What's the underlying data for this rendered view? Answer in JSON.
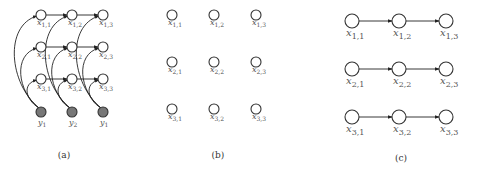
{
  "panels": [
    {
      "id": "a",
      "caption": "(a)",
      "caption_pos": [
        64,
        158
      ],
      "description": "Grid of latent nodes x_{i,j} with horizontal chains and observed nodes y connected to all nodes in column",
      "nodes": [
        {
          "id": "x11",
          "var": "x",
          "sub": "1,1",
          "cx": 41,
          "cy": 15,
          "r": 5
        },
        {
          "id": "x12",
          "var": "x",
          "sub": "1,2",
          "cx": 72,
          "cy": 15,
          "r": 5
        },
        {
          "id": "x13",
          "var": "x",
          "sub": "1,3",
          "cx": 103,
          "cy": 15,
          "r": 5
        },
        {
          "id": "x21",
          "var": "x",
          "sub": "2,1",
          "cx": 41,
          "cy": 47,
          "r": 5
        },
        {
          "id": "x22",
          "var": "x",
          "sub": "2,2",
          "cx": 72,
          "cy": 47,
          "r": 5
        },
        {
          "id": "x23",
          "var": "x",
          "sub": "2,3",
          "cx": 103,
          "cy": 47,
          "r": 5
        },
        {
          "id": "x31",
          "var": "x",
          "sub": "3,1",
          "cx": 41,
          "cy": 79,
          "r": 5
        },
        {
          "id": "x32",
          "var": "x",
          "sub": "3,2",
          "cx": 72,
          "cy": 79,
          "r": 5
        },
        {
          "id": "x33",
          "var": "x",
          "sub": "3,3",
          "cx": 103,
          "cy": 79,
          "r": 5
        }
      ],
      "observed": [
        {
          "id": "y1",
          "var": "y",
          "sub": "1",
          "cx": 41,
          "cy": 112,
          "r": 5
        },
        {
          "id": "y2",
          "var": "y",
          "sub": "2",
          "cx": 72,
          "cy": 112,
          "r": 5
        },
        {
          "id": "y3",
          "var": "y",
          "sub": "1",
          "cx": 103,
          "cy": 112,
          "r": 5
        }
      ],
      "arrows": [
        [
          "x11",
          "x12"
        ],
        [
          "x12",
          "x13"
        ],
        [
          "x21",
          "x22"
        ],
        [
          "x22",
          "x23"
        ],
        [
          "x31",
          "x32"
        ],
        [
          "x32",
          "x33"
        ]
      ],
      "column_links": [
        [
          "y1",
          "x11"
        ],
        [
          "y1",
          "x21"
        ],
        [
          "y1",
          "x31"
        ],
        [
          "y2",
          "x12"
        ],
        [
          "y2",
          "x22"
        ],
        [
          "y2",
          "x32"
        ],
        [
          "y3",
          "x13"
        ],
        [
          "y3",
          "x23"
        ],
        [
          "y3",
          "x33"
        ]
      ]
    },
    {
      "id": "b",
      "caption": "(b)",
      "caption_pos": [
        218,
        158
      ],
      "description": "Independent latent nodes, no edges",
      "nodes": [
        {
          "id": "x11",
          "var": "x",
          "sub": "1,1",
          "cx": 172,
          "cy": 15,
          "r": 5
        },
        {
          "id": "x12",
          "var": "x",
          "sub": "1,2",
          "cx": 214,
          "cy": 15,
          "r": 5
        },
        {
          "id": "x13",
          "var": "x",
          "sub": "1,3",
          "cx": 256,
          "cy": 15,
          "r": 5
        },
        {
          "id": "x21",
          "var": "x",
          "sub": "2,1",
          "cx": 172,
          "cy": 62,
          "r": 5
        },
        {
          "id": "x22",
          "var": "x",
          "sub": "2,2",
          "cx": 214,
          "cy": 62,
          "r": 5
        },
        {
          "id": "x23",
          "var": "x",
          "sub": "2,3",
          "cx": 256,
          "cy": 62,
          "r": 5
        },
        {
          "id": "x31",
          "var": "x",
          "sub": "3,1",
          "cx": 172,
          "cy": 109,
          "r": 5
        },
        {
          "id": "x32",
          "var": "x",
          "sub": "3,2",
          "cx": 214,
          "cy": 109,
          "r": 5
        },
        {
          "id": "x33",
          "var": "x",
          "sub": "3,3",
          "cx": 256,
          "cy": 109,
          "r": 5
        }
      ],
      "arrows": []
    },
    {
      "id": "c",
      "caption": "(c)",
      "caption_pos": [
        401,
        161
      ],
      "description": "Three independent horizontal chains",
      "nodes": [
        {
          "id": "x11",
          "var": "x",
          "sub": "1,1",
          "cx": 352,
          "cy": 21,
          "r": 7
        },
        {
          "id": "x12",
          "var": "x",
          "sub": "1,2",
          "cx": 399,
          "cy": 21,
          "r": 7
        },
        {
          "id": "x13",
          "var": "x",
          "sub": "1,3",
          "cx": 446,
          "cy": 21,
          "r": 7
        },
        {
          "id": "x21",
          "var": "x",
          "sub": "2,1",
          "cx": 352,
          "cy": 69,
          "r": 7
        },
        {
          "id": "x22",
          "var": "x",
          "sub": "2,2",
          "cx": 399,
          "cy": 69,
          "r": 7
        },
        {
          "id": "x23",
          "var": "x",
          "sub": "2,3",
          "cx": 446,
          "cy": 69,
          "r": 7
        },
        {
          "id": "x31",
          "var": "x",
          "sub": "3,1",
          "cx": 352,
          "cy": 117,
          "r": 7
        },
        {
          "id": "x32",
          "var": "x",
          "sub": "3,2",
          "cx": 399,
          "cy": 117,
          "r": 7
        },
        {
          "id": "x33",
          "var": "x",
          "sub": "3,3",
          "cx": 446,
          "cy": 117,
          "r": 7
        }
      ],
      "arrows": [
        [
          "x11",
          "x12"
        ],
        [
          "x12",
          "x13"
        ],
        [
          "x21",
          "x22"
        ],
        [
          "x22",
          "x23"
        ],
        [
          "x31",
          "x32"
        ],
        [
          "x32",
          "x33"
        ]
      ]
    }
  ],
  "colors": {
    "node_fill": "#ffffff",
    "node_stroke": "#333333",
    "observed_fill": "#777777",
    "edge": "#222222",
    "label": "#555555"
  }
}
